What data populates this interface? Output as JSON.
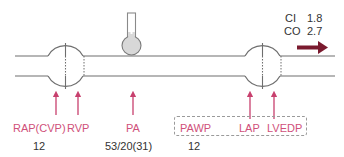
{
  "diagram": {
    "colors": {
      "line": "#6e6e6e",
      "label": "#d0507a",
      "arrow": "#c8406e",
      "flow_arrow": "#7a1a2e",
      "manometer_fill": "#d8d8d8",
      "text": "#333333"
    },
    "structures": {
      "right_heart_chamber": "right-heart",
      "left_heart_chamber": "left-heart",
      "pulmonary_artery_tube": "pulmonary-artery",
      "pressure_gauge": "manometer"
    },
    "measurements": [
      {
        "id": "rap",
        "label": "RAP(CVP)",
        "value": "12"
      },
      {
        "id": "rvp",
        "label": "RVP",
        "value": ""
      },
      {
        "id": "pa",
        "label": "PA",
        "value": "53/20(31)"
      },
      {
        "id": "pawp",
        "label": "PAWP",
        "value": "12"
      },
      {
        "id": "lap",
        "label": "LAP",
        "value": ""
      },
      {
        "id": "lvedp",
        "label": "LVEDP",
        "value": ""
      }
    ],
    "output": {
      "ci_label": "CI",
      "ci_value": "1.8",
      "co_label": "CO",
      "co_value": "2.7",
      "flow_icon": "right-arrow-icon"
    }
  }
}
